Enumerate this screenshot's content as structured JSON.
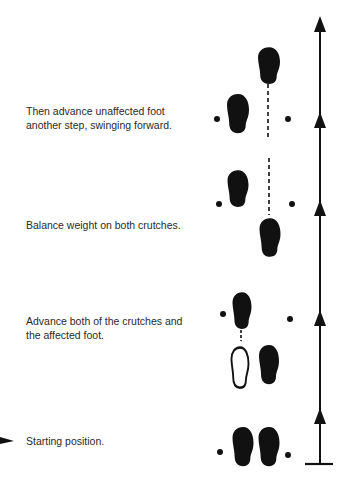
{
  "steps": [
    {
      "id": "step-4",
      "text_line1": "Then advance unaffected foot",
      "text_line2": "another step, swinging forward."
    },
    {
      "id": "step-3",
      "text_line1": "Balance weight on both crutches.",
      "text_line2": ""
    },
    {
      "id": "step-2",
      "text_line1": "Advance both of the crutches and",
      "text_line2": "the affected foot."
    },
    {
      "id": "step-1",
      "text_line1": "Starting position.",
      "text_line2": ""
    }
  ],
  "colors": {
    "ink": "#111111",
    "background": "#ffffff"
  }
}
